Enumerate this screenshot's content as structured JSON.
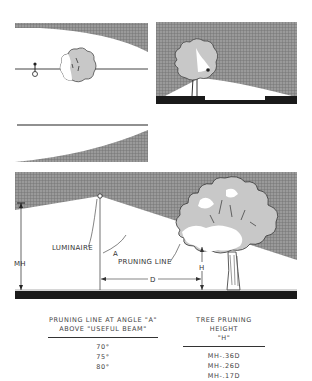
{
  "figure": {
    "panels": [
      {
        "id": "top-left",
        "description": "luminaire on pole with shrub, light distribution curve above"
      },
      {
        "id": "top-right",
        "description": "tree partially blocking light beam, dark ground"
      },
      {
        "id": "middle-left",
        "description": "horizontal line with rising shaded curve below"
      },
      {
        "id": "main",
        "description": "pruning line geometry diagram"
      }
    ],
    "labels": {
      "luminaire": "LUMINAIRE",
      "angle": "A",
      "pruning_line": "PRUNING LINE",
      "mounting_height": "MH",
      "distance": "D",
      "height": "H"
    }
  },
  "table": {
    "col_a_header_line1": "PRUNING LINE AT ANGLE \"A\"",
    "col_a_header_line2": "ABOVE \"USEFUL BEAM\"",
    "col_b_header_line1": "TREE PRUNING HEIGHT",
    "col_b_header_line2": "\"H\"",
    "rows": [
      {
        "angle": "70°",
        "height": "MH-.36D"
      },
      {
        "angle": "75°",
        "height": "MH-.26D"
      },
      {
        "angle": "80°",
        "height": "MH-.17D"
      }
    ]
  },
  "colors": {
    "shade": "#8c8c8c",
    "ground": "#1a1a1a",
    "foliage_light": "#c8c8c8",
    "line": "#333333"
  }
}
